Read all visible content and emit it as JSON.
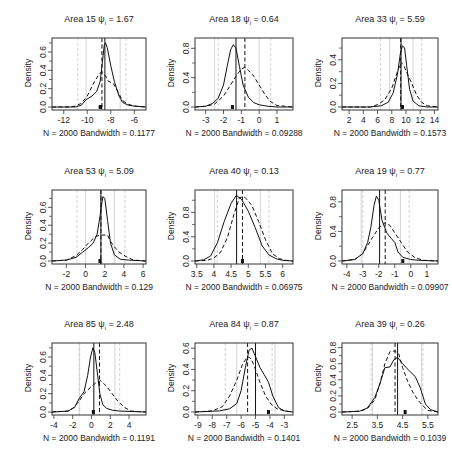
{
  "chart_data": [
    {
      "type": "line",
      "title": "Area 15",
      "psi": "1.67",
      "xlabel": "N = 2000   Bandwidth = 0.1177",
      "ylabel": "Density",
      "xlim": [
        -13,
        -5
      ],
      "ylim": [
        0,
        0.72
      ],
      "xticks": [
        -12,
        -10,
        -8,
        -6
      ],
      "yticks": [
        0.0,
        0.2,
        0.4,
        0.6
      ],
      "solid_vline": -8.5,
      "dashed_vline": -8.75,
      "gray_solid_vlines": [
        -10.1,
        -7.2
      ],
      "gray_dashed_vlines": [
        -10.8,
        -6.7
      ],
      "marks": [
        -8.9,
        -8.85
      ],
      "series": [
        {
          "name": "solid",
          "x": [
            -13,
            -11,
            -10.5,
            -10.1,
            -9.6,
            -9.2,
            -8.9,
            -8.7,
            -8.55,
            -8.45,
            -8.3,
            -8.0,
            -7.7,
            -7.3,
            -7.0,
            -6.5,
            -6,
            -5
          ],
          "y": [
            0,
            0,
            0.02,
            0.08,
            0.12,
            0.17,
            0.28,
            0.5,
            0.68,
            0.7,
            0.65,
            0.45,
            0.28,
            0.12,
            0.05,
            0.02,
            0.01,
            0
          ]
        },
        {
          "name": "dashed",
          "x": [
            -13,
            -11.5,
            -11,
            -10.5,
            -10,
            -9.5,
            -9.0,
            -8.8,
            -8.5,
            -8.2,
            -7.8,
            -7.4,
            -7,
            -6.5,
            -6,
            -5
          ],
          "y": [
            0,
            0,
            0.01,
            0.04,
            0.12,
            0.25,
            0.36,
            0.38,
            0.35,
            0.28,
            0.26,
            0.17,
            0.07,
            0.03,
            0.01,
            0
          ]
        }
      ]
    },
    {
      "type": "line",
      "title": "Area 18",
      "psi": "0.64",
      "xlabel": "N = 2000   Bandwidth = 0.09288",
      "ylabel": "Density",
      "xlim": [
        -3.6,
        1.9
      ],
      "ylim": [
        0,
        0.9
      ],
      "xticks": [
        -3,
        -2,
        -1,
        0,
        1
      ],
      "yticks": [
        0.0,
        0.4,
        0.8
      ],
      "solid_vline": -1.3,
      "dashed_vline": -0.8,
      "gray_solid_vlines": [
        -2.5,
        0
      ],
      "gray_dashed_vlines": [
        -2.3,
        0.65
      ],
      "marks": [
        -1.5
      ],
      "series": [
        {
          "name": "solid",
          "x": [
            -3.6,
            -3,
            -2.6,
            -2.3,
            -2.0,
            -1.8,
            -1.6,
            -1.45,
            -1.3,
            -1.1,
            -0.9,
            -0.6,
            -0.3,
            0,
            0.5,
            1,
            1.9
          ],
          "y": [
            0,
            0.01,
            0.05,
            0.12,
            0.3,
            0.55,
            0.78,
            0.85,
            0.8,
            0.55,
            0.3,
            0.13,
            0.06,
            0.03,
            0.01,
            0,
            0
          ]
        },
        {
          "name": "dashed",
          "x": [
            -3.6,
            -3,
            -2.5,
            -2,
            -1.6,
            -1.3,
            -1,
            -0.8,
            -0.6,
            -0.3,
            0,
            0.3,
            0.6,
            1,
            1.9
          ],
          "y": [
            0,
            0.01,
            0.04,
            0.15,
            0.3,
            0.42,
            0.52,
            0.54,
            0.5,
            0.42,
            0.3,
            0.18,
            0.08,
            0.02,
            0
          ]
        }
      ]
    },
    {
      "type": "line",
      "title": "Area 33",
      "psi": "5.59",
      "xlabel": "N = 2000   Bandwidth = 0.1573",
      "ylabel": "Density",
      "xlim": [
        1,
        14.5
      ],
      "ylim": [
        0,
        0.56
      ],
      "xticks": [
        2,
        4,
        6,
        8,
        10,
        12,
        14
      ],
      "yticks": [
        0.0,
        0.2,
        0.4
      ],
      "solid_vline": 9.3,
      "dashed_vline": 9.25,
      "gray_solid_vlines": [
        7.7,
        11.0
      ],
      "gray_dashed_vlines": [
        6.4,
        12.2
      ],
      "marks": [
        9.5
      ],
      "series": [
        {
          "name": "solid",
          "x": [
            1,
            5,
            6.5,
            7.5,
            8.2,
            8.8,
            9.2,
            9.5,
            9.8,
            10.1,
            10.5,
            11,
            11.8,
            13,
            14.5
          ],
          "y": [
            0,
            0,
            0.01,
            0.04,
            0.12,
            0.28,
            0.45,
            0.52,
            0.5,
            0.35,
            0.15,
            0.05,
            0.01,
            0,
            0
          ]
        },
        {
          "name": "dashed",
          "x": [
            1,
            5,
            6,
            7,
            8,
            8.8,
            9.3,
            9.7,
            10.2,
            10.8,
            11.5,
            12.2,
            13,
            14.5
          ],
          "y": [
            0,
            0,
            0.02,
            0.06,
            0.16,
            0.3,
            0.38,
            0.35,
            0.28,
            0.2,
            0.1,
            0.04,
            0.01,
            0
          ]
        }
      ]
    },
    {
      "type": "line",
      "title": "Area 53",
      "psi": "5.09",
      "xlabel": "N = 2000   Bandwidth = 0.129",
      "ylabel": "Density",
      "xlim": [
        -3.5,
        6.3
      ],
      "ylim": [
        0,
        0.76
      ],
      "xticks": [
        -2,
        0,
        2,
        4,
        6
      ],
      "yticks": [
        0.0,
        0.2,
        0.4,
        0.6
      ],
      "solid_vline": 1.6,
      "dashed_vline": 1.6,
      "gray_solid_vlines": [
        0.0,
        3.0
      ],
      "gray_dashed_vlines": [
        -0.9,
        4.1
      ],
      "marks": [
        1.5
      ],
      "series": [
        {
          "name": "solid",
          "x": [
            -3.5,
            -2,
            -1,
            -0.3,
            0.3,
            0.8,
            1.2,
            1.5,
            1.8,
            2.0,
            2.3,
            2.6,
            3.0,
            3.6,
            4.5,
            6.3
          ],
          "y": [
            0,
            0.01,
            0.04,
            0.1,
            0.15,
            0.2,
            0.3,
            0.5,
            0.72,
            0.7,
            0.45,
            0.2,
            0.07,
            0.02,
            0.01,
            0
          ]
        },
        {
          "name": "dashed",
          "x": [
            -3.5,
            -2,
            -1,
            -0.3,
            0.3,
            1,
            1.5,
            2.3,
            2.6,
            3,
            3.5,
            4.2,
            5,
            6.3
          ],
          "y": [
            0,
            0.01,
            0.06,
            0.13,
            0.2,
            0.27,
            0.29,
            0.29,
            0.22,
            0.16,
            0.1,
            0.05,
            0.01,
            0
          ]
        }
      ]
    },
    {
      "type": "line",
      "title": "Area 40",
      "psi": "0.13",
      "xlabel": "N = 2000   Bandwidth = 0.06975",
      "ylabel": "Density",
      "xlim": [
        3.45,
        6.3
      ],
      "ylim": [
        0,
        1.12
      ],
      "xticks": [
        3.5,
        4.0,
        4.5,
        5.0,
        5.5,
        6.0
      ],
      "yticks": [
        0.0,
        0.4,
        0.8
      ],
      "solid_vline": 4.66,
      "dashed_vline": 4.83,
      "gray_solid_vlines": [
        4.02,
        5.35
      ],
      "gray_dashed_vlines": [
        4.1,
        5.6
      ],
      "marks": [
        4.83
      ],
      "series": [
        {
          "name": "solid",
          "x": [
            3.45,
            3.7,
            3.9,
            4.1,
            4.3,
            4.5,
            4.65,
            4.8,
            5.0,
            5.2,
            5.4,
            5.6,
            5.8,
            6.0,
            6.3
          ],
          "y": [
            0,
            0.02,
            0.08,
            0.3,
            0.65,
            0.95,
            1.08,
            1.02,
            0.82,
            0.55,
            0.25,
            0.1,
            0.04,
            0.01,
            0
          ]
        },
        {
          "name": "dashed",
          "x": [
            3.45,
            3.8,
            4.0,
            4.2,
            4.4,
            4.6,
            4.75,
            4.9,
            5.1,
            5.3,
            5.5,
            5.7,
            5.9,
            6.1,
            6.3
          ],
          "y": [
            0,
            0.01,
            0.05,
            0.15,
            0.4,
            0.8,
            1.05,
            1.05,
            0.92,
            0.65,
            0.35,
            0.12,
            0.04,
            0.01,
            0
          ]
        }
      ]
    },
    {
      "type": "line",
      "title": "Area 19",
      "psi": "0.77",
      "xlabel": "N = 2000   Bandwidth = 0.09907",
      "ylabel": "Density",
      "xlim": [
        -4.3,
        1.7
      ],
      "ylim": [
        0,
        0.92
      ],
      "xticks": [
        -4,
        -3,
        -2,
        -1,
        0,
        1
      ],
      "yticks": [
        0.0,
        0.4,
        0.8
      ],
      "solid_vline": -1.95,
      "dashed_vline": -1.6,
      "gray_solid_vlines": [
        -3.1,
        -0.65
      ],
      "gray_dashed_vlines": [
        -3.0,
        -0.1
      ],
      "marks": [
        -0.5
      ],
      "series": [
        {
          "name": "solid",
          "x": [
            -4.3,
            -3.5,
            -3.0,
            -2.7,
            -2.5,
            -2.3,
            -2.15,
            -2.0,
            -1.8,
            -1.5,
            -1.2,
            -1.0,
            -0.8,
            -0.5,
            0,
            0.5,
            1.7
          ],
          "y": [
            0,
            0.02,
            0.1,
            0.25,
            0.45,
            0.75,
            0.88,
            0.82,
            0.55,
            0.38,
            0.3,
            0.25,
            0.12,
            0.05,
            0.02,
            0.01,
            0
          ]
        },
        {
          "name": "dashed",
          "x": [
            -4.3,
            -3.5,
            -3.0,
            -2.5,
            -2.0,
            -1.6,
            -1.3,
            -1.0,
            -0.6,
            -0.2,
            0.3,
            0.8,
            1.7
          ],
          "y": [
            0,
            0.02,
            0.1,
            0.28,
            0.45,
            0.52,
            0.48,
            0.38,
            0.25,
            0.12,
            0.04,
            0.01,
            0
          ]
        }
      ]
    },
    {
      "type": "line",
      "title": "Area 85",
      "psi": "2.48",
      "xlabel": "N = 2000   Bandwidth = 0.1191",
      "ylabel": "Density",
      "xlim": [
        -4.2,
        5.8
      ],
      "ylim": [
        0,
        0.72
      ],
      "xticks": [
        -4,
        -2,
        0,
        2,
        4
      ],
      "yticks": [
        0.0,
        0.2,
        0.4,
        0.6
      ],
      "solid_vline": 0.25,
      "dashed_vline": 0.85,
      "gray_solid_vlines": [
        -1.3,
        2.5
      ],
      "gray_dashed_vlines": [
        -1.25,
        3.0
      ],
      "marks": [
        0.2
      ],
      "series": [
        {
          "name": "solid",
          "x": [
            -4.2,
            -2.5,
            -1.8,
            -1.3,
            -0.8,
            -0.4,
            -0.1,
            0.15,
            0.35,
            0.6,
            0.9,
            1.2,
            1.6,
            2.2,
            3,
            5.8
          ],
          "y": [
            0,
            0.01,
            0.05,
            0.15,
            0.22,
            0.4,
            0.6,
            0.7,
            0.65,
            0.45,
            0.2,
            0.08,
            0.04,
            0.02,
            0.01,
            0
          ]
        },
        {
          "name": "dashed",
          "x": [
            -4.2,
            -2.5,
            -2,
            -1.3,
            -0.8,
            0,
            0.6,
            1.0,
            1.6,
            2.2,
            2.8,
            3.5,
            4.2,
            5.8
          ],
          "y": [
            0,
            0.01,
            0.04,
            0.12,
            0.2,
            0.28,
            0.33,
            0.34,
            0.28,
            0.2,
            0.12,
            0.05,
            0.01,
            0
          ]
        }
      ]
    },
    {
      "type": "line",
      "title": "Area 84",
      "psi": "0.87",
      "xlabel": "N = 2000   Bandwidth = 0.1401",
      "ylabel": "Density",
      "xlim": [
        -9.2,
        -2.4
      ],
      "ylim": [
        0,
        0.62
      ],
      "xticks": [
        -9,
        -8,
        -7,
        -6,
        -5,
        -4,
        -3
      ],
      "yticks": [
        0.0,
        0.2,
        0.4,
        0.6
      ],
      "solid_vline": -5.0,
      "dashed_vline": -5.55,
      "gray_solid_vlines": [
        -6.3,
        -3.65
      ],
      "gray_dashed_vlines": [
        -7.1,
        -3.85
      ],
      "marks": [
        -4.1
      ],
      "series": [
        {
          "name": "solid",
          "x": [
            -9.2,
            -7.5,
            -6.8,
            -6.3,
            -6.0,
            -5.7,
            -5.45,
            -5.25,
            -5.0,
            -4.7,
            -4.4,
            -4.1,
            -3.8,
            -3.4,
            -3,
            -2.4
          ],
          "y": [
            0,
            0.01,
            0.03,
            0.08,
            0.2,
            0.42,
            0.58,
            0.6,
            0.52,
            0.42,
            0.35,
            0.28,
            0.15,
            0.04,
            0.01,
            0
          ]
        },
        {
          "name": "dashed",
          "x": [
            -9.2,
            -8,
            -7.3,
            -6.8,
            -6.3,
            -5.9,
            -5.55,
            -5.3,
            -5.0,
            -4.7,
            -4.3,
            -3.9,
            -3.5,
            -3,
            -2.4
          ],
          "y": [
            0,
            0.01,
            0.05,
            0.15,
            0.3,
            0.45,
            0.52,
            0.5,
            0.4,
            0.28,
            0.15,
            0.07,
            0.03,
            0.01,
            0
          ]
        }
      ]
    },
    {
      "type": "line",
      "title": "Area 39",
      "psi": "0.26",
      "xlabel": "N = 2000   Bandwidth = 0.1039",
      "ylabel": "Density",
      "xlim": [
        2.1,
        5.9
      ],
      "ylim": [
        0,
        0.82
      ],
      "xticks": [
        2.5,
        3.5,
        4.5,
        5.5
      ],
      "yticks": [
        0.0,
        0.2,
        0.4,
        0.6,
        0.8
      ],
      "solid_vline": 4.3,
      "dashed_vline": 4.2,
      "gray_solid_vlines": [
        3.3,
        5.25
      ],
      "gray_dashed_vlines": [
        3.25,
        5.3
      ],
      "marks": [
        4.6
      ],
      "series": [
        {
          "name": "solid",
          "x": [
            2.1,
            2.8,
            3.1,
            3.4,
            3.6,
            3.8,
            4.0,
            4.15,
            4.3,
            4.5,
            4.8,
            5.0,
            5.2,
            5.4,
            5.6,
            5.9
          ],
          "y": [
            0,
            0.01,
            0.05,
            0.18,
            0.35,
            0.55,
            0.56,
            0.65,
            0.68,
            0.6,
            0.5,
            0.44,
            0.3,
            0.1,
            0.03,
            0
          ]
        },
        {
          "name": "dashed",
          "x": [
            2.1,
            2.8,
            3.1,
            3.4,
            3.6,
            3.8,
            4.0,
            4.2,
            4.35,
            4.5,
            4.7,
            4.9,
            5.1,
            5.3,
            5.5,
            5.9
          ],
          "y": [
            0,
            0.01,
            0.04,
            0.15,
            0.35,
            0.6,
            0.75,
            0.76,
            0.72,
            0.55,
            0.38,
            0.25,
            0.15,
            0.08,
            0.02,
            0
          ]
        }
      ]
    }
  ],
  "panels": [
    {
      "title": "Area 15",
      "psi_label": "ψ",
      "psi_sub": "i",
      "psi_value": "= 1.67",
      "ylabel": "Density",
      "xlabel": "N = 2000   Bandwidth = 0.1177"
    },
    {
      "title": "Area 18",
      "psi_label": "ψ",
      "psi_sub": "i",
      "psi_value": "= 0.64",
      "ylabel": "Density",
      "xlabel": "N = 2000   Bandwidth = 0.09288"
    },
    {
      "title": "Area 33",
      "psi_label": "ψ",
      "psi_sub": "i",
      "psi_value": "= 5.59",
      "ylabel": "Density",
      "xlabel": "N = 2000   Bandwidth = 0.1573"
    },
    {
      "title": "Area 53",
      "psi_label": "ψ",
      "psi_sub": "i",
      "psi_value": "= 5.09",
      "ylabel": "Density",
      "xlabel": "N = 2000   Bandwidth = 0.129"
    },
    {
      "title": "Area 40",
      "psi_label": "ψ",
      "psi_sub": "i",
      "psi_value": "= 0.13",
      "ylabel": "Density",
      "xlabel": "N = 2000   Bandwidth = 0.06975"
    },
    {
      "title": "Area 19",
      "psi_label": "ψ",
      "psi_sub": "i",
      "psi_value": "= 0.77",
      "ylabel": "Density",
      "xlabel": "N = 2000   Bandwidth = 0.09907"
    },
    {
      "title": "Area 85",
      "psi_label": "ψ",
      "psi_sub": "i",
      "psi_value": "= 2.48",
      "ylabel": "Density",
      "xlabel": "N = 2000   Bandwidth = 0.1191"
    },
    {
      "title": "Area 84",
      "psi_label": "ψ",
      "psi_sub": "i",
      "psi_value": "= 0.87",
      "ylabel": "Density",
      "xlabel": "N = 2000   Bandwidth = 0.1401"
    },
    {
      "title": "Area 39",
      "psi_label": "ψ",
      "psi_sub": "i",
      "psi_value": "= 0.26",
      "ylabel": "Density",
      "xlabel": "N = 2000   Bandwidth = 0.1039"
    }
  ],
  "colors": {
    "curve": "#111111",
    "gray_line": "#c8c8c8",
    "frame": "#333333"
  }
}
